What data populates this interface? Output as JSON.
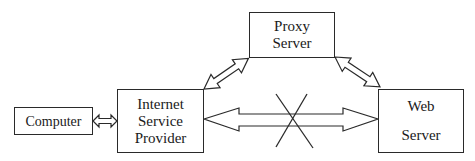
{
  "diagram": {
    "nodes": {
      "computer": {
        "label": "Computer"
      },
      "isp": {
        "lines": [
          "Internet",
          "Service",
          "Provider"
        ]
      },
      "proxy": {
        "lines": [
          "Proxy",
          "Server"
        ]
      },
      "web": {
        "lines": [
          "Web",
          "Server"
        ]
      }
    },
    "edges": [
      {
        "from": "Computer",
        "to": "Internet Service Provider",
        "type": "bidirectional-arrow"
      },
      {
        "from": "Internet Service Provider",
        "to": "Proxy Server",
        "type": "bidirectional-arrow"
      },
      {
        "from": "Proxy Server",
        "to": "Web Server",
        "type": "bidirectional-arrow"
      },
      {
        "from": "Internet Service Provider",
        "to": "Web Server",
        "type": "bidirectional-arrow",
        "blocked": true,
        "marker": "X"
      }
    ],
    "colors": {
      "stroke": "#2a2a2a",
      "background": "#ffffff"
    }
  }
}
